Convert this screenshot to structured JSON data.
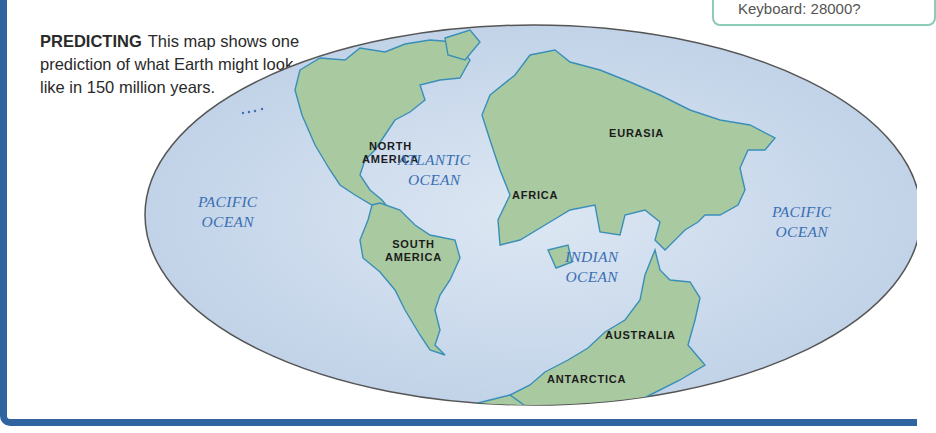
{
  "caption": {
    "heading": "PREDICTING",
    "text": "This map shows one prediction of what Earth might look like in 150 million years."
  },
  "top_box": {
    "text": "Keyboard: 28000?"
  },
  "map": {
    "projection": "oval world map",
    "colors": {
      "ocean": "#c9d8ea",
      "land": "#a9c9a0",
      "coast": "#3a8fb8",
      "outline": "#555555",
      "frame": "#2f64a0"
    },
    "continents": [
      {
        "id": "north-america",
        "line1": "NORTH",
        "line2": "AMERICA"
      },
      {
        "id": "south-america",
        "line1": "SOUTH",
        "line2": "AMERICA"
      },
      {
        "id": "eurasia",
        "line1": "EURASIA"
      },
      {
        "id": "africa",
        "line1": "AFRICA"
      },
      {
        "id": "australia",
        "line1": "AUSTRALIA"
      },
      {
        "id": "antarctica",
        "line1": "ANTARCTICA"
      }
    ],
    "oceans": [
      {
        "id": "pacific-west",
        "line1": "PACIFIC",
        "line2": "OCEAN"
      },
      {
        "id": "atlantic",
        "line1": "ATLANTIC",
        "line2": "OCEAN"
      },
      {
        "id": "indian",
        "line1": "INDIAN",
        "line2": "OCEAN"
      },
      {
        "id": "pacific-east",
        "line1": "PACIFIC",
        "line2": "OCEAN"
      }
    ]
  }
}
